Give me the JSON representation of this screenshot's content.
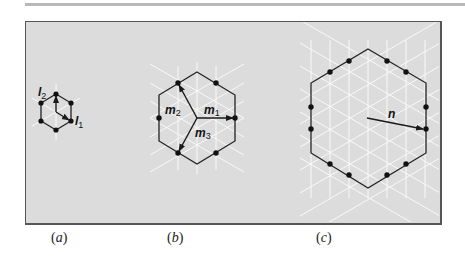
{
  "figure": {
    "panel_color": "#dcdcdc",
    "line_color": "#222222",
    "lattice_color": "#ffffff",
    "subfigures": [
      {
        "id": "a",
        "caption": "a",
        "vector_labels": [
          {
            "base": "l",
            "sub": "2"
          },
          {
            "base": "l",
            "sub": "1"
          }
        ],
        "dots": 6
      },
      {
        "id": "b",
        "caption": "b",
        "vector_labels": [
          {
            "base": "m",
            "sub": "1"
          },
          {
            "base": "m",
            "sub": "2"
          },
          {
            "base": "m",
            "sub": "3"
          }
        ],
        "dots": 6
      },
      {
        "id": "c",
        "caption": "c",
        "vector_labels": [
          {
            "base": "n",
            "sub": ""
          }
        ],
        "dots": 12
      }
    ]
  },
  "labels": {
    "a_l2": "l",
    "a_l2_sub": "2",
    "a_l1": "l",
    "a_l1_sub": "1",
    "b_m1": "m",
    "b_m1_sub": "1",
    "b_m2": "m",
    "b_m2_sub": "2",
    "b_m3": "m",
    "b_m3_sub": "3",
    "c_n": "n",
    "cap_a": "a",
    "cap_b": "b",
    "cap_c": "c",
    "paren_open": "(",
    "paren_close": ")"
  }
}
